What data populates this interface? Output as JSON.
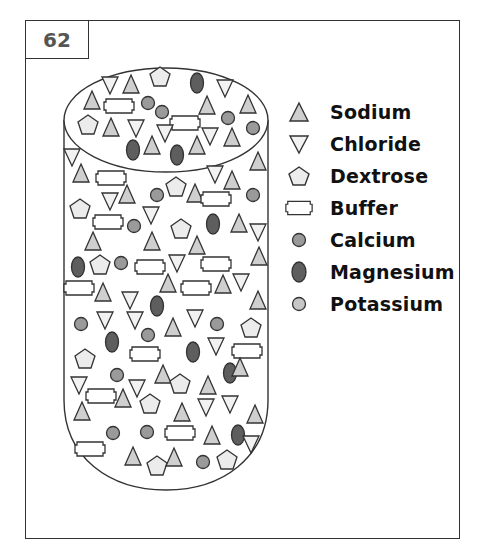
{
  "figure": {
    "number": "62"
  },
  "colors": {
    "stroke": "#333333",
    "sodium_fill": "#cfcfcf",
    "chloride_fill": "#f2f2f2",
    "dextrose_fill": "#ececec",
    "buffer_fill": "#ffffff",
    "calcium_fill": "#9a9a9a",
    "magnesium_fill": "#5e5e5e",
    "potassium_fill": "#c6c6c6"
  },
  "legend": {
    "items": [
      {
        "key": "sodium",
        "icon": "triangle-up-icon",
        "label": "Sodium"
      },
      {
        "key": "chloride",
        "icon": "triangle-down-icon",
        "label": "Chloride"
      },
      {
        "key": "dextrose",
        "icon": "pentagon-icon",
        "label": "Dextrose"
      },
      {
        "key": "buffer",
        "icon": "notched-rectangle-icon",
        "label": "Buffer"
      },
      {
        "key": "calcium",
        "icon": "circle-medium-icon",
        "label": "Calcium"
      },
      {
        "key": "magnesium",
        "icon": "oval-dark-icon",
        "label": "Magnesium"
      },
      {
        "key": "potassium",
        "icon": "circle-light-icon",
        "label": "Potassium"
      }
    ]
  },
  "container": {
    "shape": "cylinder",
    "description": "Cylindrical container filled with mixed particles"
  },
  "particles": [
    {
      "t": "chloride",
      "x": 110,
      "y": 85
    },
    {
      "t": "sodium",
      "x": 131,
      "y": 85
    },
    {
      "t": "dextrose",
      "x": 160,
      "y": 77
    },
    {
      "t": "magnesium",
      "x": 197,
      "y": 83
    },
    {
      "t": "chloride",
      "x": 225,
      "y": 88
    },
    {
      "t": "sodium",
      "x": 92,
      "y": 101
    },
    {
      "t": "buffer",
      "x": 119,
      "y": 106
    },
    {
      "t": "calcium",
      "x": 148,
      "y": 103
    },
    {
      "t": "calcium",
      "x": 162,
      "y": 112
    },
    {
      "t": "sodium",
      "x": 207,
      "y": 106
    },
    {
      "t": "sodium",
      "x": 248,
      "y": 105
    },
    {
      "t": "dextrose",
      "x": 88,
      "y": 125
    },
    {
      "t": "sodium",
      "x": 111,
      "y": 128
    },
    {
      "t": "chloride",
      "x": 136,
      "y": 128
    },
    {
      "t": "buffer",
      "x": 185,
      "y": 123
    },
    {
      "t": "calcium",
      "x": 228,
      "y": 118
    },
    {
      "t": "calcium",
      "x": 253,
      "y": 128
    },
    {
      "t": "magnesium",
      "x": 133,
      "y": 150
    },
    {
      "t": "sodium",
      "x": 152,
      "y": 146
    },
    {
      "t": "chloride",
      "x": 165,
      "y": 133
    },
    {
      "t": "magnesium",
      "x": 177,
      "y": 155
    },
    {
      "t": "sodium",
      "x": 197,
      "y": 146
    },
    {
      "t": "chloride",
      "x": 210,
      "y": 136
    },
    {
      "t": "sodium",
      "x": 232,
      "y": 138
    },
    {
      "t": "chloride",
      "x": 72,
      "y": 157
    },
    {
      "t": "sodium",
      "x": 81,
      "y": 174
    },
    {
      "t": "sodium",
      "x": 258,
      "y": 162
    },
    {
      "t": "chloride",
      "x": 215,
      "y": 174
    },
    {
      "t": "sodium",
      "x": 232,
      "y": 181
    },
    {
      "t": "buffer",
      "x": 111,
      "y": 178
    },
    {
      "t": "calcium",
      "x": 157,
      "y": 195
    },
    {
      "t": "dextrose",
      "x": 176,
      "y": 187
    },
    {
      "t": "sodium",
      "x": 195,
      "y": 194
    },
    {
      "t": "buffer",
      "x": 216,
      "y": 199
    },
    {
      "t": "calcium",
      "x": 253,
      "y": 195
    },
    {
      "t": "chloride",
      "x": 110,
      "y": 201
    },
    {
      "t": "sodium",
      "x": 127,
      "y": 195
    },
    {
      "t": "dextrose",
      "x": 80,
      "y": 209
    },
    {
      "t": "buffer",
      "x": 108,
      "y": 222
    },
    {
      "t": "calcium",
      "x": 134,
      "y": 226
    },
    {
      "t": "chloride",
      "x": 151,
      "y": 215
    },
    {
      "t": "dextrose",
      "x": 181,
      "y": 229
    },
    {
      "t": "magnesium",
      "x": 213,
      "y": 224
    },
    {
      "t": "sodium",
      "x": 239,
      "y": 224
    },
    {
      "t": "chloride",
      "x": 258,
      "y": 232
    },
    {
      "t": "sodium",
      "x": 93,
      "y": 242
    },
    {
      "t": "sodium",
      "x": 152,
      "y": 242
    },
    {
      "t": "sodium",
      "x": 197,
      "y": 246
    },
    {
      "t": "sodium",
      "x": 259,
      "y": 257
    },
    {
      "t": "magnesium",
      "x": 78,
      "y": 267
    },
    {
      "t": "dextrose",
      "x": 100,
      "y": 265
    },
    {
      "t": "calcium",
      "x": 121,
      "y": 263
    },
    {
      "t": "buffer",
      "x": 150,
      "y": 267
    },
    {
      "t": "chloride",
      "x": 177,
      "y": 263
    },
    {
      "t": "buffer",
      "x": 216,
      "y": 264
    },
    {
      "t": "buffer",
      "x": 79,
      "y": 288
    },
    {
      "t": "sodium",
      "x": 103,
      "y": 293
    },
    {
      "t": "sodium",
      "x": 168,
      "y": 284
    },
    {
      "t": "buffer",
      "x": 196,
      "y": 288
    },
    {
      "t": "sodium",
      "x": 223,
      "y": 285
    },
    {
      "t": "chloride",
      "x": 241,
      "y": 282
    },
    {
      "t": "chloride",
      "x": 130,
      "y": 300
    },
    {
      "t": "magnesium",
      "x": 157,
      "y": 306
    },
    {
      "t": "sodium",
      "x": 258,
      "y": 301
    },
    {
      "t": "calcium",
      "x": 81,
      "y": 324
    },
    {
      "t": "chloride",
      "x": 105,
      "y": 320
    },
    {
      "t": "chloride",
      "x": 135,
      "y": 320
    },
    {
      "t": "sodium",
      "x": 173,
      "y": 328
    },
    {
      "t": "chloride",
      "x": 195,
      "y": 318
    },
    {
      "t": "calcium",
      "x": 217,
      "y": 324
    },
    {
      "t": "dextrose",
      "x": 251,
      "y": 328
    },
    {
      "t": "magnesium",
      "x": 112,
      "y": 342
    },
    {
      "t": "calcium",
      "x": 148,
      "y": 335
    },
    {
      "t": "buffer",
      "x": 145,
      "y": 354
    },
    {
      "t": "magnesium",
      "x": 193,
      "y": 352
    },
    {
      "t": "chloride",
      "x": 216,
      "y": 346
    },
    {
      "t": "buffer",
      "x": 247,
      "y": 351
    },
    {
      "t": "dextrose",
      "x": 85,
      "y": 359
    },
    {
      "t": "calcium",
      "x": 117,
      "y": 375
    },
    {
      "t": "sodium",
      "x": 163,
      "y": 375
    },
    {
      "t": "dextrose",
      "x": 180,
      "y": 384
    },
    {
      "t": "magnesium",
      "x": 230,
      "y": 373
    },
    {
      "t": "sodium",
      "x": 240,
      "y": 368
    },
    {
      "t": "chloride",
      "x": 79,
      "y": 385
    },
    {
      "t": "buffer",
      "x": 101,
      "y": 396
    },
    {
      "t": "sodium",
      "x": 123,
      "y": 399
    },
    {
      "t": "chloride",
      "x": 137,
      "y": 388
    },
    {
      "t": "sodium",
      "x": 208,
      "y": 386
    },
    {
      "t": "sodium",
      "x": 82,
      "y": 412
    },
    {
      "t": "dextrose",
      "x": 150,
      "y": 404
    },
    {
      "t": "chloride",
      "x": 206,
      "y": 407
    },
    {
      "t": "chloride",
      "x": 230,
      "y": 404
    },
    {
      "t": "sodium",
      "x": 182,
      "y": 413
    },
    {
      "t": "sodium",
      "x": 255,
      "y": 415
    },
    {
      "t": "calcium",
      "x": 113,
      "y": 433
    },
    {
      "t": "calcium",
      "x": 147,
      "y": 432
    },
    {
      "t": "buffer",
      "x": 180,
      "y": 433
    },
    {
      "t": "sodium",
      "x": 212,
      "y": 436
    },
    {
      "t": "magnesium",
      "x": 238,
      "y": 435
    },
    {
      "t": "chloride",
      "x": 251,
      "y": 444
    },
    {
      "t": "buffer",
      "x": 90,
      "y": 449
    },
    {
      "t": "sodium",
      "x": 133,
      "y": 457
    },
    {
      "t": "dextrose",
      "x": 157,
      "y": 466
    },
    {
      "t": "sodium",
      "x": 174,
      "y": 458
    },
    {
      "t": "calcium",
      "x": 203,
      "y": 462
    },
    {
      "t": "dextrose",
      "x": 227,
      "y": 460
    }
  ]
}
